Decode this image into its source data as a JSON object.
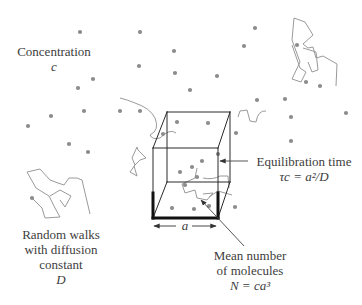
{
  "labels": {
    "concentration": {
      "line1": "Concentration",
      "symbol": "c"
    },
    "random_walks": {
      "line1": "Random walks",
      "line2": "with diffusion",
      "line3": "constant",
      "symbol": "D"
    },
    "equilibration": {
      "line1": "Equilibration time",
      "formula": "τc = a²/D"
    },
    "mean_number": {
      "line1": "Mean number",
      "line2": "of molecules",
      "formula": "N = ca³"
    },
    "edge": {
      "symbol": "a"
    }
  },
  "colors": {
    "dot": "#8c8c8c",
    "walk": "#9a9a9a",
    "cube": "#2a2a2a",
    "cube_bold": "#111111",
    "text": "#3d3d3d"
  },
  "molecules": [
    [
      80,
      32
    ],
    [
      140,
      32
    ],
    [
      255,
      28
    ],
    [
      174,
      51
    ],
    [
      244,
      46
    ],
    [
      139,
      66
    ],
    [
      175,
      73
    ],
    [
      93,
      79
    ],
    [
      78,
      88
    ],
    [
      297,
      45
    ],
    [
      320,
      86
    ],
    [
      217,
      76
    ],
    [
      190,
      90
    ],
    [
      306,
      82
    ],
    [
      285,
      99
    ],
    [
      346,
      113
    ],
    [
      257,
      100
    ],
    [
      51,
      116
    ],
    [
      28,
      126
    ],
    [
      84,
      111
    ],
    [
      120,
      111
    ],
    [
      140,
      111
    ],
    [
      69,
      144
    ],
    [
      88,
      152
    ],
    [
      163,
      134
    ],
    [
      177,
      122
    ],
    [
      208,
      123
    ],
    [
      236,
      133
    ],
    [
      291,
      141
    ],
    [
      202,
      161
    ],
    [
      192,
      167
    ],
    [
      180,
      172
    ],
    [
      218,
      154
    ],
    [
      185,
      185
    ],
    [
      197,
      177
    ],
    [
      172,
      208
    ],
    [
      194,
      209
    ],
    [
      209,
      206
    ],
    [
      235,
      207
    ],
    [
      291,
      117
    ],
    [
      32,
      198
    ]
  ],
  "walks": [
    "M 120 98 Q 128 100 135 103 Q 150 108 155 118 Q 160 130 150 135 Q 152 140 160 138 Q 170 128 176 133",
    "M 137 147 L 132 158 L 135 165 L 130 172 L 137 176 L 134 166 L 140 160 L 146 158 L 138 150 Z",
    "M 292 45 L 300 68 L 306 72 L 301 82 L 292 79 L 300 62 L 292 40 L 294 18 L 305 22 L 313 35 L 303 44 L 308 48 L 313 47 L 316 58 L 323 56 L 337 64 L 336 86",
    "M 303 48 L 316 52 L 318 70 L 312 72 L 308 62",
    "M 32 198 L 42 208 L 45 218 L 60 217 L 55 208 L 49 196 L 36 188 L 27 172 L 40 169 L 50 180 L 58 183 L 64 185 L 69 178 L 77 178 L 82 180 L 90 214",
    "M 50 196 L 60 190 L 71 196 L 65 207 L 60 200",
    "M 197 168 L 195 178 L 182 184 L 185 193 L 195 190 L 197 198 L 207 200 L 213 193 L 203 194",
    "M 229 188 L 228 176 L 220 176 Q 213 180 203 178",
    "M 209 197 L 218 191 L 232 195",
    "M 238 117 L 240 111 L 247 110 L 250 121 L 256 122 Q 258 110 266 111"
  ],
  "cube": {
    "back": [
      [
        167,
        112
      ],
      [
        230,
        112
      ],
      [
        230,
        182
      ],
      [
        167,
        182
      ]
    ],
    "front": [
      [
        153,
        148
      ],
      [
        218,
        148
      ],
      [
        218,
        218
      ],
      [
        153,
        218
      ]
    ],
    "bold_segments": [
      [
        [
          153,
          218
        ],
        [
          218,
          218
        ]
      ],
      [
        [
          153,
          218
        ],
        [
          153,
          193
        ]
      ],
      [
        [
          218,
          218
        ],
        [
          218,
          193
        ]
      ]
    ]
  }
}
